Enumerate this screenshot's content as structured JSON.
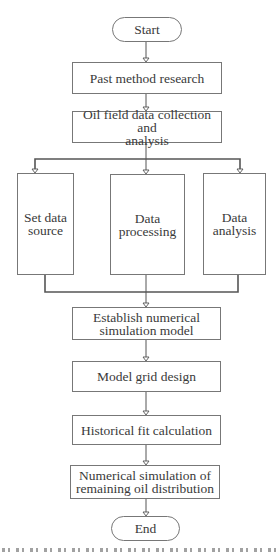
{
  "diagram": {
    "type": "flowchart",
    "nodes": {
      "start": "Start",
      "past_method": "Past method research",
      "oil_field_line1": "Oil field data collection and",
      "oil_field_line2": "analysis",
      "set_data_line1": "Set data",
      "set_data_line2": "source",
      "processing_line1": "Data",
      "processing_line2": "processing",
      "analysis_line1": "Data",
      "analysis_line2": "analysis",
      "establish_line1": "Establish numerical",
      "establish_line2": "simulation model",
      "grid": "Model grid design",
      "historical": "Historical fit calculation",
      "numerical_line1": "Numerical simulation of",
      "numerical_line2": "remaining oil distribution",
      "end": "End"
    },
    "colors": {
      "line": "#555555",
      "box_border": "#777777",
      "text": "#3a3a3a"
    }
  }
}
